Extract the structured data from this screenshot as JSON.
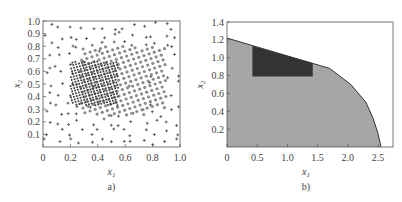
{
  "chart_data": [
    {
      "type": "scatter",
      "panel_label": "a)",
      "xlabel": "x1",
      "ylabel": "x2",
      "xlim": [
        0,
        1.0
      ],
      "ylim": [
        0,
        1.0
      ],
      "xticks": [
        "0",
        "0.2",
        "0.4",
        "0.6",
        "0.8",
        "1.0"
      ],
      "yticks": [
        "0.1",
        "0.2",
        "0.3",
        "0.4",
        "0.5",
        "0.6",
        "0.7",
        "0.8",
        "0.9",
        "1.0"
      ],
      "grid": false,
      "series": [
        {
          "name": "background samples",
          "marker": "+",
          "color": "#333333",
          "region": {
            "x": [
              0,
              1
            ],
            "y": [
              0,
              1
            ]
          },
          "count": 170
        },
        {
          "name": "feasible region samples",
          "marker": "circle",
          "color": "#8c8c8c",
          "region": {
            "x": [
              0.27,
              0.9
            ],
            "y": [
              0.25,
              0.8
            ]
          },
          "count": 300
        },
        {
          "name": "dense sub-region samples",
          "marker": "circle-small",
          "color": "#3a3a3a",
          "region": {
            "x": [
              0.2,
              0.55
            ],
            "y": [
              0.33,
              0.68
            ]
          },
          "count": 260
        }
      ]
    },
    {
      "type": "area",
      "panel_label": "b)",
      "xlabel": "x1",
      "ylabel": "x2",
      "xlim": [
        0,
        2.75
      ],
      "ylim": [
        0,
        1.4
      ],
      "xticks": [
        "0",
        "0.5",
        "1.0",
        "1.5",
        "2.0",
        "2.5"
      ],
      "yticks": [
        "0.2",
        "0.4",
        "0.6",
        "0.8",
        "1.0",
        "1.2",
        "1.4"
      ],
      "grid": false,
      "series": [
        {
          "name": "feasible region",
          "color": "#a6a6a6",
          "boundary": [
            [
              0,
              1.22
            ],
            [
              1.7,
              0.88
            ],
            [
              2.05,
              0.7
            ],
            [
              2.3,
              0.5
            ],
            [
              2.42,
              0.32
            ],
            [
              2.5,
              0.15
            ],
            [
              2.55,
              0.0
            ]
          ]
        },
        {
          "name": "inner region",
          "color": "#333333",
          "boundary": [
            [
              0.42,
              0.79
            ],
            [
              0.42,
              1.13
            ],
            [
              1.42,
              0.94
            ],
            [
              1.42,
              0.79
            ]
          ]
        }
      ]
    }
  ]
}
